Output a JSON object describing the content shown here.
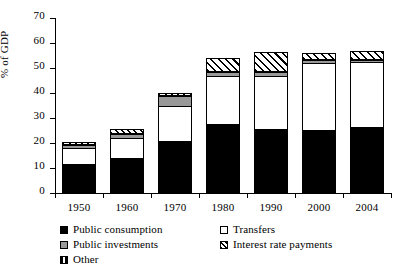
{
  "chart_data": {
    "type": "bar",
    "subtype": "stacked-bar",
    "title": "",
    "xlabel": "",
    "ylabel": "% of GDP",
    "ylim": [
      0,
      70
    ],
    "ytick_step": 10,
    "yticks": [
      0,
      10,
      20,
      30,
      40,
      50,
      60,
      70
    ],
    "grid": false,
    "legend_position": "bottom",
    "categories": [
      "1950",
      "1960",
      "1970",
      "1980",
      "1990",
      "2000",
      "2004"
    ],
    "series": [
      {
        "name": "Public consumption",
        "marker": "solid-black",
        "color": "#000000",
        "values": [
          11.6,
          14.2,
          21.0,
          27.5,
          25.8,
          25.3,
          26.3
        ]
      },
      {
        "name": "Transfers",
        "marker": "white-open",
        "color": "#ffffff",
        "values": [
          6.0,
          7.3,
          13.5,
          19.0,
          20.8,
          26.5,
          25.8
        ]
      },
      {
        "name": "Public investments",
        "marker": "gray",
        "color": "#999999",
        "values": [
          1.5,
          2.0,
          4.4,
          2.0,
          1.7,
          1.4,
          1.3
        ]
      },
      {
        "name": "Interest rate payments",
        "marker": "diagonal-hatch",
        "color": "#ffffff",
        "values": [
          0.0,
          0.0,
          0.0,
          5.5,
          8.2,
          3.0,
          3.6
        ]
      },
      {
        "name": "Other",
        "marker": "split-black",
        "color": "#ffffff",
        "values": [
          1.4,
          2.0,
          1.1,
          0.0,
          0.0,
          0.0,
          0.0
        ]
      }
    ],
    "totals": [
      20.5,
      25.5,
      40.0,
      54.0,
      56.5,
      56.2,
      57.0
    ]
  },
  "axes": {
    "y_title": "% of GDP",
    "y_tick_labels": [
      "70",
      "60",
      "50",
      "40",
      "30",
      "20",
      "10",
      "0"
    ],
    "x_tick_labels": [
      "1950",
      "1960",
      "1970",
      "1980",
      "1990",
      "2000",
      "2004"
    ]
  },
  "legend": {
    "rows": [
      {
        "left": {
          "label": "Public consumption",
          "swatch": "sw-black"
        },
        "right": {
          "label": "Transfers",
          "swatch": "sw-white"
        }
      },
      {
        "left": {
          "label": "Public investments",
          "swatch": "sw-gray"
        },
        "right": {
          "label": "Interest rate payments",
          "swatch": "sw-hatch"
        }
      },
      {
        "left": {
          "label": "Other",
          "swatch": "sw-other"
        },
        "right": null
      }
    ]
  }
}
